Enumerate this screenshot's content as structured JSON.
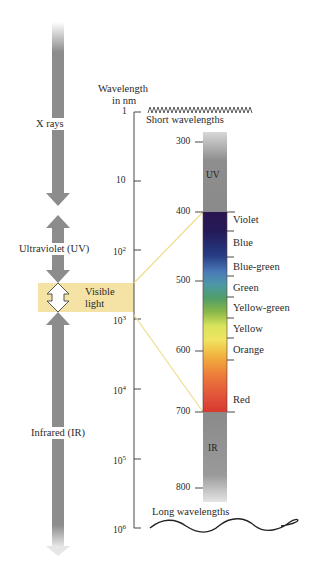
{
  "left_column": {
    "x_rays_label": "X rays",
    "ultraviolet_label": "Ultraviolet (UV)",
    "visible_label_line1": "Visible",
    "visible_label_line2": "light",
    "infrared_label": "Infrared (IR)"
  },
  "axis": {
    "title_line1": "Wavelength",
    "title_line2": "in nm",
    "ticks": [
      {
        "label": "1",
        "base": "1",
        "exp": ""
      },
      {
        "label": "10",
        "base": "10",
        "exp": ""
      },
      {
        "label": "10^2",
        "base": "10",
        "exp": "2"
      },
      {
        "label": "10^3",
        "base": "10",
        "exp": "3"
      },
      {
        "label": "10^4",
        "base": "10",
        "exp": "4"
      },
      {
        "label": "10^5",
        "base": "10",
        "exp": "5"
      },
      {
        "label": "10^6",
        "base": "10",
        "exp": "6"
      }
    ]
  },
  "wave_labels": {
    "short": "Short wavelengths",
    "long": "Long wavelengths"
  },
  "spectrum": {
    "uv_label": "UV",
    "ir_label": "IR",
    "ticks": [
      "300",
      "400",
      "500",
      "600",
      "700",
      "800"
    ],
    "colors": [
      {
        "name": "Violet"
      },
      {
        "name": "Blue"
      },
      {
        "name": "Blue-green"
      },
      {
        "name": "Green"
      },
      {
        "name": "Yellow-green"
      },
      {
        "name": "Yellow"
      },
      {
        "name": "Orange"
      },
      {
        "name": "Red"
      }
    ]
  },
  "style": {
    "arrow_gray": "#8c8c8c",
    "visible_band": "#f5e3a6",
    "connector_line": "#f0dc8a"
  }
}
